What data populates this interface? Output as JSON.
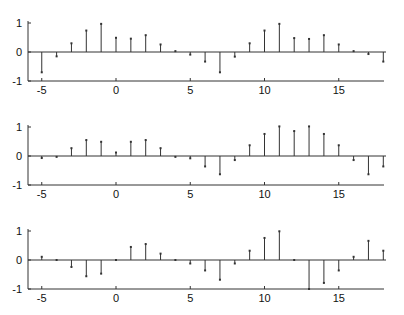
{
  "figure": {
    "background": "#ffffff",
    "line_color": "#333333",
    "text_color": "#111111"
  },
  "chart_data": [
    {
      "type": "stem",
      "title": "",
      "xlabel": "",
      "ylabel": "",
      "xlim": [
        -6,
        18
      ],
      "ylim": [
        -1,
        1
      ],
      "xticks": [
        -5,
        0,
        5,
        10,
        15
      ],
      "xtick_labels": [
        "-5",
        "0",
        "5",
        "10",
        "15"
      ],
      "yticks": [
        -1,
        0,
        1
      ],
      "ytick_labels": [
        "-1",
        "0",
        "1"
      ],
      "grid": false,
      "x": [
        -5,
        -4,
        -3,
        -2,
        -1,
        0,
        1,
        2,
        3,
        4,
        5,
        6,
        7,
        8,
        9,
        10,
        11,
        12,
        13,
        14,
        15,
        16,
        17,
        18
      ],
      "values": [
        -0.7,
        -0.15,
        0.3,
        0.74,
        0.97,
        0.49,
        0.46,
        0.58,
        0.26,
        0.03,
        -0.09,
        -0.33,
        -0.7,
        -0.16,
        0.3,
        0.74,
        0.97,
        0.48,
        0.45,
        0.58,
        0.26,
        0.03,
        -0.07,
        -0.33
      ]
    },
    {
      "type": "stem",
      "title": "",
      "xlabel": "",
      "ylabel": "",
      "xlim": [
        -6,
        18
      ],
      "ylim": [
        -1,
        1
      ],
      "xticks": [
        -5,
        0,
        5,
        10,
        15
      ],
      "xtick_labels": [
        "-5",
        "0",
        "5",
        "10",
        "15"
      ],
      "yticks": [
        -1,
        0,
        1
      ],
      "ytick_labels": [
        "-1",
        "0",
        "1"
      ],
      "grid": false,
      "x": [
        -5,
        -4,
        -3,
        -2,
        -1,
        0,
        1,
        2,
        3,
        4,
        5,
        6,
        7,
        8,
        9,
        10,
        11,
        12,
        13,
        14,
        15,
        16,
        17,
        18
      ],
      "values": [
        -0.07,
        -0.03,
        0.27,
        0.55,
        0.49,
        0.12,
        0.49,
        0.55,
        0.27,
        -0.03,
        -0.08,
        -0.36,
        -0.63,
        -0.14,
        0.37,
        0.76,
        1.02,
        0.86,
        1.02,
        0.76,
        0.37,
        -0.14,
        -0.63,
        -0.36
      ]
    },
    {
      "type": "stem",
      "title": "",
      "xlabel": "",
      "ylabel": "",
      "xlim": [
        -6,
        18
      ],
      "ylim": [
        -1,
        1
      ],
      "xticks": [
        -5,
        0,
        5,
        10,
        15
      ],
      "xtick_labels": [
        "-5",
        "0",
        "5",
        "10",
        "15"
      ],
      "yticks": [
        -1,
        0,
        1
      ],
      "ytick_labels": [
        "-1",
        "0",
        "1"
      ],
      "grid": false,
      "x": [
        -5,
        -4,
        -3,
        -2,
        -1,
        0,
        1,
        2,
        3,
        4,
        5,
        6,
        7,
        8,
        9,
        10,
        11,
        12,
        13,
        14,
        15,
        16,
        17,
        18
      ],
      "values": [
        0.11,
        0.0,
        -0.24,
        -0.56,
        -0.47,
        0.0,
        0.45,
        0.55,
        0.22,
        0.0,
        -0.12,
        -0.36,
        -0.68,
        -0.12,
        0.32,
        0.76,
        0.99,
        0.0,
        -1.0,
        -0.79,
        -0.36,
        0.11,
        0.66,
        0.32
      ]
    }
  ]
}
